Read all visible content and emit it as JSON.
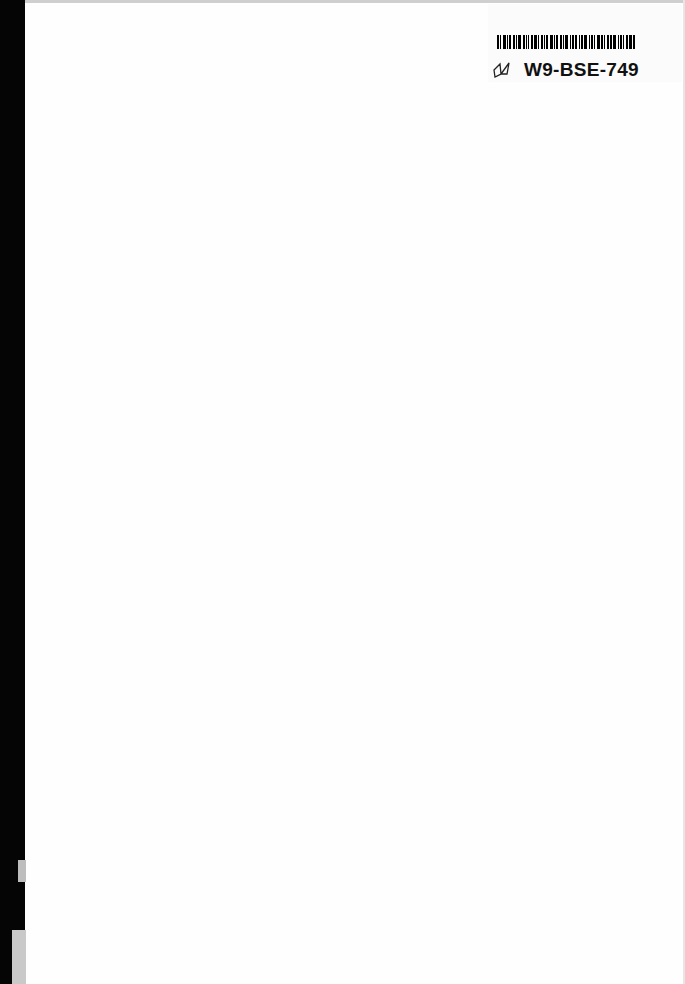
{
  "page": {
    "type": "blank endpaper",
    "background_color": "#fefefe",
    "spine_color": "#050505"
  },
  "barcode_label": {
    "code": "W9-BSE-749",
    "icon": "book-icon"
  }
}
